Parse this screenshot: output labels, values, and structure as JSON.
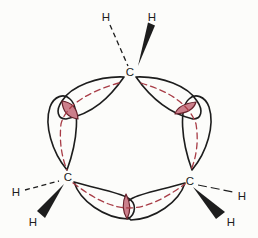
{
  "diagram": {
    "kind": "orbital-overlap-structure",
    "atoms": {
      "carbons": [
        {
          "label": "C",
          "position": "top"
        },
        {
          "label": "C",
          "position": "bottom-left"
        },
        {
          "label": "C",
          "position": "bottom-right"
        }
      ],
      "hydrogens": [
        {
          "label": "H",
          "position": "top-left",
          "bond": "dashed"
        },
        {
          "label": "H",
          "position": "top-right",
          "bond": "wedge"
        },
        {
          "label": "H",
          "position": "left",
          "bond": "dashed"
        },
        {
          "label": "H",
          "position": "lower-left",
          "bond": "wedge"
        },
        {
          "label": "H",
          "position": "right",
          "bond": "dashed"
        },
        {
          "label": "H",
          "position": "lower-right",
          "bond": "wedge"
        }
      ]
    },
    "counts": {
      "orbital_lobes": 6,
      "overlap_regions": 3,
      "bent_bond_dashes": 3
    }
  },
  "colors": {
    "background": "#fcfcfa",
    "outline": "#1d1d1d",
    "label": "#1d1d1d",
    "overlap_fill": "#cc7f8b",
    "overlap_stroke": "#66202a",
    "bent_bond_dash": "#a83c46"
  }
}
